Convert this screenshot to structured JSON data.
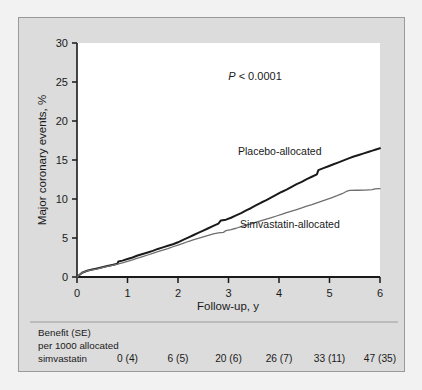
{
  "figure": {
    "panel_bg": "#dcdcdc",
    "plot_bg": "#ffffff",
    "outer_bg": "#f2f2f2",
    "border_color": "#9a9a9a"
  },
  "chart_data": {
    "type": "line",
    "title": "",
    "subtitle": "",
    "xlabel": "Follow-up, y",
    "ylabel": "Major coronary events, %",
    "xlim": [
      0,
      6
    ],
    "ylim": [
      0,
      30
    ],
    "xticks": [
      "0",
      "1",
      "2",
      "3",
      "4",
      "5",
      "6"
    ],
    "yticks": [
      "0",
      "5",
      "10",
      "15",
      "20",
      "25",
      "30"
    ],
    "grid": false,
    "legend_position": "inline-annotations",
    "annotations": [
      {
        "name": "p-value",
        "text_italic": "P",
        "text": " < 0.0001",
        "x": 3.55,
        "y": 22.0
      },
      {
        "name": "placebo-curve-label",
        "text": "Placebo-allocated",
        "x": 3.6,
        "y": 15.6
      },
      {
        "name": "simvastatin-curve-label",
        "text": "Simvastatin-allocated",
        "x": 3.6,
        "y": 5.2
      }
    ],
    "series": [
      {
        "name": "Placebo-allocated",
        "color": "#1a1a1a",
        "width": 2.0,
        "x": [
          0.0,
          0.1,
          0.2,
          0.3,
          0.4,
          0.5,
          0.6,
          0.7,
          0.8,
          0.82,
          0.9,
          1.0,
          1.1,
          1.2,
          1.3,
          1.4,
          1.5,
          1.6,
          1.7,
          1.8,
          1.9,
          2.0,
          2.1,
          2.2,
          2.3,
          2.4,
          2.5,
          2.6,
          2.7,
          2.8,
          2.85,
          2.95,
          3.05,
          3.15,
          3.25,
          3.35,
          3.45,
          3.55,
          3.65,
          3.75,
          3.85,
          3.95,
          4.05,
          4.15,
          4.25,
          4.35,
          4.45,
          4.55,
          4.65,
          4.75,
          4.78,
          4.88,
          4.98,
          5.08,
          5.18,
          5.28,
          5.38,
          5.48,
          5.58,
          5.68,
          5.78,
          5.85,
          5.92,
          6.0
        ],
        "y": [
          0.0,
          0.55,
          0.8,
          0.95,
          1.1,
          1.25,
          1.4,
          1.55,
          1.7,
          2.0,
          2.1,
          2.3,
          2.5,
          2.75,
          2.95,
          3.15,
          3.35,
          3.6,
          3.8,
          4.0,
          4.2,
          4.45,
          4.75,
          5.05,
          5.35,
          5.65,
          5.95,
          6.25,
          6.55,
          6.85,
          7.25,
          7.35,
          7.6,
          7.9,
          8.2,
          8.55,
          8.85,
          9.2,
          9.55,
          9.85,
          10.2,
          10.55,
          10.9,
          11.2,
          11.55,
          11.9,
          12.2,
          12.55,
          12.85,
          13.15,
          13.7,
          13.95,
          14.2,
          14.45,
          14.7,
          14.95,
          15.2,
          15.45,
          15.65,
          15.85,
          16.05,
          16.2,
          16.35,
          16.5
        ]
      },
      {
        "name": "Simvastatin-allocated",
        "color": "#6e6e6e",
        "width": 1.3,
        "x": [
          0.0,
          0.1,
          0.2,
          0.3,
          0.4,
          0.5,
          0.6,
          0.7,
          0.8,
          0.9,
          1.0,
          1.1,
          1.2,
          1.3,
          1.4,
          1.5,
          1.6,
          1.7,
          1.8,
          1.9,
          2.0,
          2.1,
          2.2,
          2.3,
          2.4,
          2.5,
          2.6,
          2.7,
          2.8,
          2.9,
          2.95,
          3.05,
          3.15,
          3.25,
          3.35,
          3.45,
          3.55,
          3.65,
          3.75,
          3.85,
          3.95,
          4.05,
          4.15,
          4.25,
          4.35,
          4.45,
          4.55,
          4.65,
          4.75,
          4.85,
          4.95,
          5.05,
          5.15,
          5.25,
          5.35,
          5.4,
          5.55,
          5.7,
          5.85,
          5.9,
          6.0
        ],
        "y": [
          0.0,
          0.55,
          0.78,
          0.92,
          1.05,
          1.2,
          1.35,
          1.5,
          1.65,
          1.82,
          2.0,
          2.2,
          2.42,
          2.62,
          2.82,
          3.02,
          3.25,
          3.45,
          3.65,
          3.88,
          4.1,
          4.32,
          4.55,
          4.75,
          4.95,
          5.15,
          5.35,
          5.52,
          5.65,
          5.72,
          5.95,
          6.08,
          6.25,
          6.45,
          6.65,
          6.82,
          7.02,
          7.22,
          7.42,
          7.62,
          7.82,
          8.02,
          8.25,
          8.45,
          8.65,
          8.85,
          9.08,
          9.28,
          9.5,
          9.72,
          9.95,
          10.18,
          10.42,
          10.68,
          11.02,
          11.1,
          11.12,
          11.14,
          11.2,
          11.3,
          11.32
        ]
      }
    ]
  },
  "benefit_note": {
    "line1": "Benefit (SE)",
    "line2": "per 1000 allocated",
    "line3": "simvastatin",
    "values": [
      {
        "year": 1,
        "label": "0 (4)"
      },
      {
        "year": 2,
        "label": "6 (5)"
      },
      {
        "year": 3,
        "label": "20 (6)"
      },
      {
        "year": 4,
        "label": "26 (7)"
      },
      {
        "year": 5,
        "label": "33 (11)"
      },
      {
        "year": 6,
        "label": "47 (35)"
      }
    ]
  }
}
